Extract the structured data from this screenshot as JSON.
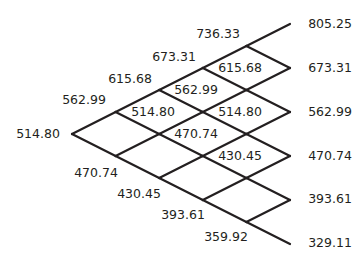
{
  "diagram": {
    "type": "binomial-tree",
    "steps": 5,
    "line_color": "#231f20",
    "text_color": "#231f20",
    "layout": {
      "x0": 72,
      "y0": 134,
      "dx": 43.6,
      "dy": 22
    },
    "nodes": [
      [
        "514.80"
      ],
      [
        "562.99",
        "470.74"
      ],
      [
        "615.68",
        "514.80",
        "430.45"
      ],
      [
        "673.31",
        "562.99",
        "470.74",
        "393.61"
      ],
      [
        "736.33",
        "615.68",
        "514.80",
        "430.45",
        "359.92"
      ],
      [
        "805.25",
        "673.31",
        "562.99",
        "470.74",
        "393.61",
        "329.11"
      ]
    ],
    "labels": [
      {
        "text": "514.80",
        "x": 38,
        "y": 134
      },
      {
        "text": "562.99",
        "x": 84,
        "y": 100
      },
      {
        "text": "470.74",
        "x": 96,
        "y": 173
      },
      {
        "text": "615.68",
        "x": 130,
        "y": 79
      },
      {
        "text": "514.80",
        "x": 153,
        "y": 112
      },
      {
        "text": "430.45",
        "x": 139,
        "y": 194
      },
      {
        "text": "673.31",
        "x": 174,
        "y": 57
      },
      {
        "text": "562.99",
        "x": 196,
        "y": 90
      },
      {
        "text": "470.74",
        "x": 196,
        "y": 134
      },
      {
        "text": "393.61",
        "x": 183,
        "y": 215
      },
      {
        "text": "736.33",
        "x": 218,
        "y": 34
      },
      {
        "text": "615.68",
        "x": 240,
        "y": 68
      },
      {
        "text": "514.80",
        "x": 240,
        "y": 112
      },
      {
        "text": "430.45",
        "x": 240,
        "y": 156
      },
      {
        "text": "359.92",
        "x": 226,
        "y": 237
      },
      {
        "text": "805.25",
        "x": 330,
        "y": 24
      },
      {
        "text": "673.31",
        "x": 330,
        "y": 68
      },
      {
        "text": "562.99",
        "x": 330,
        "y": 112
      },
      {
        "text": "470.74",
        "x": 330,
        "y": 156
      },
      {
        "text": "393.61",
        "x": 330,
        "y": 199
      },
      {
        "text": "329.11",
        "x": 330,
        "y": 243
      }
    ]
  }
}
